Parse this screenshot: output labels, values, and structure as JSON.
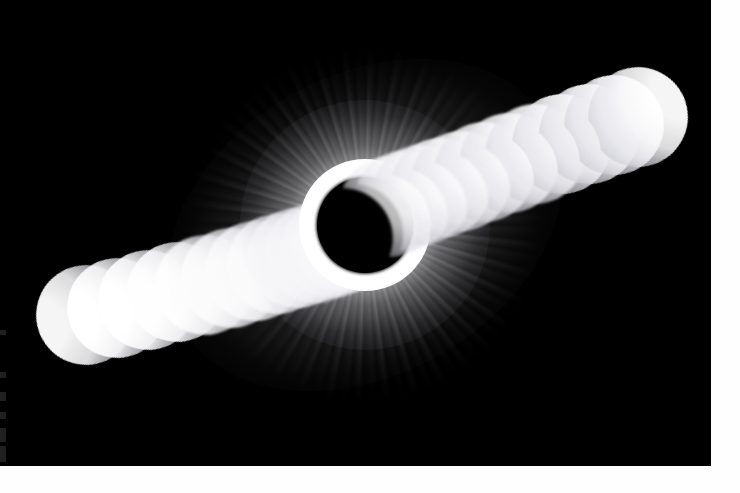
{
  "image": {
    "kind": "photograph",
    "subject": "total-solar-eclipse-composite",
    "title": "Total Solar Eclipse Composite Sequence",
    "description": "Multiple-exposure composite photograph of a total solar eclipse. Partial phases progress as a chain of crescents along a diagonal axis from lower-left to upper-right, with totality and the solar corona at the center.",
    "background_color": "#000000",
    "paper_color": "#fefefe",
    "crescent_color": "#ffffff",
    "corona_color": "#ffffff",
    "moon_color": "#000000",
    "plate": {
      "x": 0,
      "y": 0,
      "width": 711,
      "height": 466
    },
    "canvas": {
      "width": 740,
      "height": 493
    }
  },
  "totality": {
    "label": "Totality with solar corona",
    "center_x": 365,
    "center_y": 225,
    "moon_radius": 48,
    "corona_axis_angle_deg": -29,
    "streamer_count": 38
  },
  "scan_artifacts": [
    {
      "name": "edge-mark-1",
      "y": 330,
      "height": 5
    },
    {
      "name": "edge-mark-2",
      "y": 372,
      "height": 6
    },
    {
      "name": "edge-mark-3",
      "y": 392,
      "height": 9
    },
    {
      "name": "edge-mark-4",
      "y": 412,
      "height": 7
    },
    {
      "name": "edge-mark-5",
      "y": 428,
      "height": 14
    },
    {
      "name": "edge-mark-6",
      "y": 446,
      "height": 16
    }
  ],
  "sequence": {
    "label": "Partial phase exposures",
    "axis_angle_deg": -29,
    "ingress_label": "Ingress (lower-left, pre-totality)",
    "egress_label": "Egress (upper-right, post-totality)",
    "ingress_count": 12,
    "egress_count": 12,
    "total_exposures": 25
  },
  "exposures": {
    "ingress": [
      {
        "id": "L12",
        "cx": 86,
        "cy": 315,
        "r": 50,
        "cover": 0.955,
        "rot": -24,
        "dir": "left",
        "bright": 0.96,
        "blur": 0.5
      },
      {
        "id": "L11",
        "cx": 117,
        "cy": 308,
        "r": 50,
        "cover": 0.935,
        "rot": -24,
        "dir": "left",
        "bright": 1.0,
        "blur": 0.5
      },
      {
        "id": "L10",
        "cx": 148,
        "cy": 300,
        "r": 50,
        "cover": 0.91,
        "rot": -25,
        "dir": "left",
        "bright": 1.0,
        "blur": 0.6
      },
      {
        "id": "L9",
        "cx": 177,
        "cy": 292,
        "r": 50,
        "cover": 0.88,
        "rot": -26,
        "dir": "left",
        "bright": 0.98,
        "blur": 0.7
      },
      {
        "id": "L8",
        "cx": 205,
        "cy": 285,
        "r": 50,
        "cover": 0.85,
        "rot": -27,
        "dir": "left",
        "bright": 0.96,
        "blur": 0.8
      },
      {
        "id": "L7",
        "cx": 231,
        "cy": 278,
        "r": 50,
        "cover": 0.815,
        "rot": -28,
        "dir": "left",
        "bright": 0.94,
        "blur": 0.9
      },
      {
        "id": "L6",
        "cx": 255,
        "cy": 271,
        "r": 50,
        "cover": 0.78,
        "rot": -29,
        "dir": "left",
        "bright": 0.92,
        "blur": 1.0
      },
      {
        "id": "L5",
        "cx": 277,
        "cy": 264,
        "r": 50,
        "cover": 0.745,
        "rot": -30,
        "dir": "left",
        "bright": 0.9,
        "blur": 1.1
      },
      {
        "id": "L4",
        "cx": 297,
        "cy": 258,
        "r": 50,
        "cover": 0.705,
        "rot": -31,
        "dir": "left",
        "bright": 0.88,
        "blur": 1.2
      },
      {
        "id": "L3",
        "cx": 315,
        "cy": 253,
        "r": 50,
        "cover": 0.665,
        "rot": -32,
        "dir": "left",
        "bright": 0.86,
        "blur": 1.4
      },
      {
        "id": "L2",
        "cx": 331,
        "cy": 248,
        "r": 50,
        "cover": 0.62,
        "rot": -33,
        "dir": "left",
        "bright": 0.84,
        "blur": 1.6
      },
      {
        "id": "L1",
        "cx": 345,
        "cy": 243,
        "r": 50,
        "cover": 0.57,
        "rot": -34,
        "dir": "left",
        "bright": 0.8,
        "blur": 1.8
      }
    ],
    "egress": [
      {
        "id": "R1",
        "cx": 389,
        "cy": 207,
        "r": 50,
        "cover": 0.57,
        "rot": -34,
        "dir": "right",
        "bright": 0.8,
        "blur": 1.8
      },
      {
        "id": "R2",
        "cx": 404,
        "cy": 201,
        "r": 50,
        "cover": 0.62,
        "rot": -33,
        "dir": "right",
        "bright": 0.84,
        "blur": 1.6
      },
      {
        "id": "R3",
        "cx": 421,
        "cy": 195,
        "r": 50,
        "cover": 0.665,
        "rot": -32,
        "dir": "right",
        "bright": 0.86,
        "blur": 1.4
      },
      {
        "id": "R4",
        "cx": 440,
        "cy": 188,
        "r": 50,
        "cover": 0.705,
        "rot": -31,
        "dir": "right",
        "bright": 0.88,
        "blur": 1.2
      },
      {
        "id": "R5",
        "cx": 461,
        "cy": 181,
        "r": 50,
        "cover": 0.745,
        "rot": -30,
        "dir": "right",
        "bright": 0.9,
        "blur": 1.1
      },
      {
        "id": "R6",
        "cx": 484,
        "cy": 172,
        "r": 50,
        "cover": 0.78,
        "rot": -29,
        "dir": "right",
        "bright": 0.92,
        "blur": 1.0
      },
      {
        "id": "R7",
        "cx": 509,
        "cy": 163,
        "r": 50,
        "cover": 0.815,
        "rot": -28,
        "dir": "right",
        "bright": 0.94,
        "blur": 0.9
      },
      {
        "id": "R8",
        "cx": 535,
        "cy": 154,
        "r": 50,
        "cover": 0.85,
        "rot": -27,
        "dir": "right",
        "bright": 0.96,
        "blur": 0.8
      },
      {
        "id": "R9",
        "cx": 562,
        "cy": 144,
        "r": 50,
        "cover": 0.88,
        "rot": -26,
        "dir": "right",
        "bright": 0.98,
        "blur": 0.7
      },
      {
        "id": "R10",
        "cx": 589,
        "cy": 134,
        "r": 50,
        "cover": 0.91,
        "rot": -25,
        "dir": "right",
        "bright": 1.0,
        "blur": 0.6
      },
      {
        "id": "R11",
        "cx": 614,
        "cy": 125,
        "r": 50,
        "cover": 0.935,
        "rot": -24,
        "dir": "right",
        "bright": 1.0,
        "blur": 0.5
      },
      {
        "id": "R12",
        "cx": 638,
        "cy": 117,
        "r": 50,
        "cover": 0.958,
        "rot": -23,
        "dir": "right",
        "bright": 0.96,
        "blur": 0.5
      }
    ]
  }
}
